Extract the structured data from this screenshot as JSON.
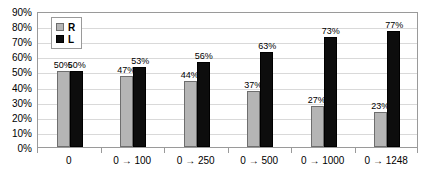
{
  "chart_data": {
    "type": "bar",
    "title": "",
    "subtitle": "",
    "xlabel": "",
    "ylabel": "",
    "ylim": [
      0,
      90
    ],
    "ytick_labels": [
      "0%",
      "10%",
      "20%",
      "30%",
      "40%",
      "50%",
      "60%",
      "70%",
      "80%",
      "90%"
    ],
    "ytick_values": [
      0,
      10,
      20,
      30,
      40,
      50,
      60,
      70,
      80,
      90
    ],
    "grid": true,
    "legend_position": "top-left-inside",
    "categories": [
      "0",
      "0 → 100",
      "0 → 250",
      "0 → 500",
      "0 → 1000",
      "0 → 1248"
    ],
    "series": [
      {
        "name": "R",
        "color": "#b5b5b5",
        "values": [
          50,
          47,
          44,
          37,
          27,
          23
        ],
        "data_labels": [
          "50%",
          "47%",
          "44%",
          "37%",
          "27%",
          "23%"
        ]
      },
      {
        "name": "L",
        "color": "#0d0d0d",
        "values": [
          50,
          53,
          56,
          63,
          73,
          77
        ],
        "data_labels": [
          "50%",
          "53%",
          "56%",
          "63%",
          "73%",
          "77%"
        ]
      }
    ]
  },
  "legend": {
    "items": [
      {
        "label": "R",
        "color": "#b5b5b5"
      },
      {
        "label": "L",
        "color": "#0d0d0d"
      }
    ]
  },
  "colors": {
    "series_r": "#b5b5b5",
    "series_l": "#0d0d0d",
    "gridline": "#d9d9d9",
    "axis_border": "#9a9a9a",
    "text": "#000000",
    "background": "#ffffff"
  }
}
